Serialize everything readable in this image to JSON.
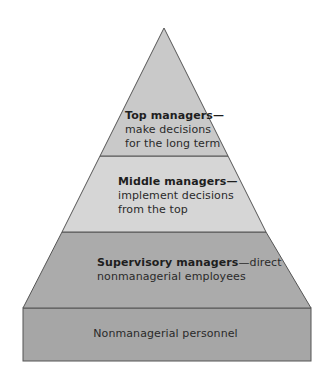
{
  "diagram": {
    "type": "pyramid",
    "tiers": [
      {
        "name": "top-managers",
        "title": "Top managers",
        "separator": "—",
        "description_line1": "make decisions",
        "description_line2": "for the long term",
        "fill": "#c9c9c9"
      },
      {
        "name": "middle-managers",
        "title": "Middle managers",
        "separator": "—",
        "description_line1": "implement decisions",
        "description_line2": "from the top",
        "fill": "#d6d6d6"
      },
      {
        "name": "supervisory-managers",
        "title": "Supervisory managers",
        "separator": "—",
        "description_line1": "direct",
        "description_line2": "nonmanagerial employees",
        "fill": "#ababab"
      },
      {
        "name": "nonmanagerial-personnel",
        "title": "Nonmanagerial personnel",
        "fill": "#a6a6a6"
      }
    ],
    "stroke": "#555555"
  }
}
